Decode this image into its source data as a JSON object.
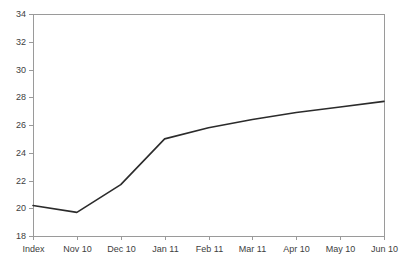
{
  "chart_data": {
    "type": "line",
    "title": "",
    "subtitle": "",
    "xlabel": "",
    "ylabel": "",
    "categories": [
      "Index",
      "Nov 10",
      "Dec 10",
      "Jan 11",
      "Feb 11",
      "Mar 11",
      "Apr 10",
      "May 10",
      "Jun 10"
    ],
    "values": [
      20.2,
      19.7,
      21.7,
      25.0,
      25.8,
      26.4,
      26.9,
      27.3,
      27.7
    ],
    "series": [
      {
        "name": "",
        "values": [
          20.2,
          19.7,
          21.7,
          25.0,
          25.8,
          26.4,
          26.9,
          27.3,
          27.7
        ]
      }
    ],
    "ylim": [
      18,
      34
    ],
    "ytick_step": 2,
    "yticks": [
      18,
      20,
      22,
      24,
      26,
      28,
      30,
      32,
      34
    ],
    "ytick_labels": [
      "18",
      "20",
      "22",
      "24",
      "26",
      "28",
      "30",
      "32",
      "34"
    ],
    "xtick_labels": [
      "Index",
      "Nov 10",
      "Dec 10",
      "Jan 11",
      "Feb 11",
      "Mar 11",
      "Apr 10",
      "May 10",
      "Jun 10"
    ],
    "grid": false,
    "legend": false,
    "legend_position": "none",
    "line_color": "#2b2b2b",
    "frame_color": "#9a9a9a",
    "background_color": "#ffffff",
    "text_color": "#404040"
  },
  "figure": {
    "plot_left_px": 33,
    "plot_right_px": 384,
    "plot_top_px": 14,
    "plot_bottom_px": 236
  }
}
